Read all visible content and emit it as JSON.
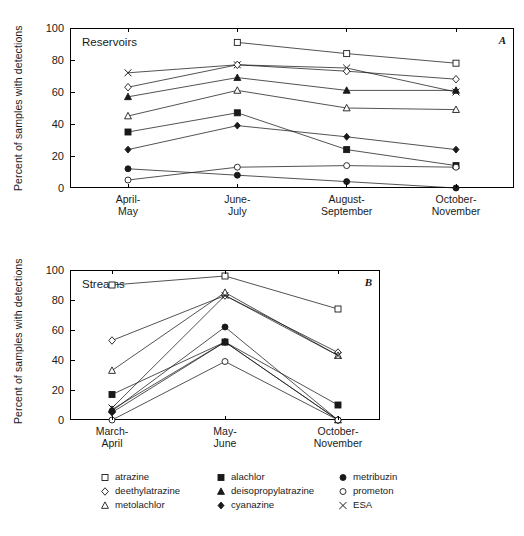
{
  "figure": {
    "ylabel": "Percent of samples with detections",
    "panel_a_letter": "A",
    "panel_b_letter": "B",
    "caption": ""
  },
  "legend": {
    "items": [
      {
        "label": "atrazine",
        "marker": "open-square",
        "key": "atrazine"
      },
      {
        "label": "alachlor",
        "marker": "filled-square",
        "key": "alachlor"
      },
      {
        "label": "metribuzin",
        "marker": "filled-circle",
        "key": "metribuzin"
      },
      {
        "label": "deethylatrazine",
        "marker": "open-diamond",
        "key": "deethylatrazine"
      },
      {
        "label": "deisopropylatrazine",
        "marker": "filled-triangle",
        "key": "deisopropylatrazine"
      },
      {
        "label": "prometon",
        "marker": "open-circle",
        "key": "prometon"
      },
      {
        "label": "metolachlor",
        "marker": "open-triangle",
        "key": "metolachlor"
      },
      {
        "label": "cyanazine",
        "marker": "filled-diamond",
        "key": "cyanazine"
      },
      {
        "label": "ESA",
        "marker": "cross",
        "key": "esa"
      }
    ]
  },
  "chart_data": [
    {
      "type": "line",
      "panel": "A",
      "title": "Reservoirs",
      "xlabel": "",
      "ylabel": "Percent of samples with detections",
      "ylim": [
        0,
        100
      ],
      "yticks": [
        0,
        20,
        40,
        60,
        80,
        100
      ],
      "grid": false,
      "legend_position": "below-figure",
      "categories": [
        "April-May",
        "June-July",
        "August-September",
        "October-November"
      ],
      "series": [
        {
          "name": "atrazine",
          "marker": "open-square",
          "values": [
            null,
            91,
            84,
            78
          ]
        },
        {
          "name": "ESA",
          "marker": "cross",
          "values": [
            72,
            77,
            75,
            60
          ]
        },
        {
          "name": "deethylatrazine",
          "marker": "open-diamond",
          "values": [
            63,
            77,
            73,
            68
          ]
        },
        {
          "name": "deisopropylatrazine",
          "marker": "filled-triangle",
          "values": [
            57,
            69,
            61,
            61
          ]
        },
        {
          "name": "metolachlor",
          "marker": "open-triangle",
          "values": [
            45,
            61,
            50,
            49
          ]
        },
        {
          "name": "alachlor",
          "marker": "filled-square",
          "values": [
            35,
            47,
            24,
            14
          ]
        },
        {
          "name": "cyanazine",
          "marker": "filled-diamond",
          "values": [
            24,
            39,
            32,
            24
          ]
        },
        {
          "name": "metribuzin",
          "marker": "filled-circle",
          "values": [
            12,
            8,
            4,
            0
          ]
        },
        {
          "name": "prometon",
          "marker": "open-circle",
          "values": [
            5,
            13,
            14,
            13
          ]
        }
      ]
    },
    {
      "type": "line",
      "panel": "B",
      "title": "Streams",
      "xlabel": "",
      "ylabel": "Percent of samples with detections",
      "ylim": [
        0,
        100
      ],
      "yticks": [
        0,
        20,
        40,
        60,
        80,
        100
      ],
      "grid": false,
      "legend_position": "below-figure",
      "categories": [
        "March-April",
        "May-June",
        "October-November"
      ],
      "series": [
        {
          "name": "atrazine",
          "marker": "open-square",
          "values": [
            90,
            96,
            74
          ]
        },
        {
          "name": "deethylatrazine",
          "marker": "open-diamond",
          "values": [
            53,
            83,
            45
          ]
        },
        {
          "name": "metolachlor",
          "marker": "open-triangle",
          "values": [
            33,
            85,
            43
          ]
        },
        {
          "name": "ESA",
          "marker": "cross",
          "values": [
            8,
            83,
            43
          ]
        },
        {
          "name": "alachlor",
          "marker": "filled-square",
          "values": [
            17,
            52,
            10
          ]
        },
        {
          "name": "metribuzin",
          "marker": "filled-circle",
          "values": [
            6,
            62,
            0
          ]
        },
        {
          "name": "deisopropylatrazine",
          "marker": "filled-triangle",
          "values": [
            7,
            52,
            0
          ]
        },
        {
          "name": "cyanazine",
          "marker": "filled-diamond",
          "values": [
            5,
            52,
            0
          ]
        },
        {
          "name": "prometon",
          "marker": "open-circle",
          "values": [
            0,
            39,
            0
          ]
        }
      ]
    }
  ]
}
